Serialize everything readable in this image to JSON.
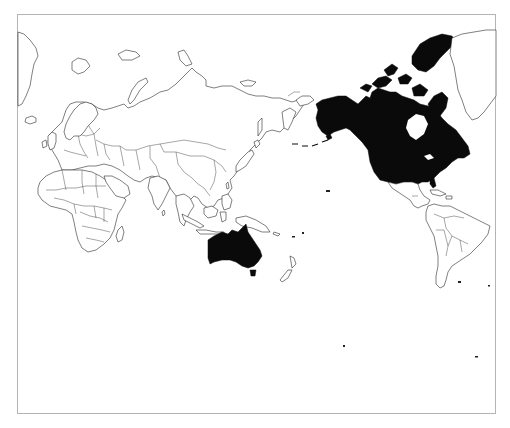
{
  "map": {
    "projection": "Pacific-centered world map",
    "style": {
      "background": "#ffffff",
      "outline_color": "#2a2a2a",
      "highlight_color": "#0a0a0a",
      "frame_color": "#b4b4b4"
    },
    "highlighted_regions": [
      {
        "name": "Canada",
        "fill": "#0a0a0a"
      },
      {
        "name": "United States (incl. Alaska)",
        "fill": "#0a0a0a"
      },
      {
        "name": "Australia (incl. Tasmania)",
        "fill": "#0a0a0a"
      }
    ],
    "outlined_regions": [
      "Greenland",
      "Europe",
      "Russia",
      "Africa",
      "Middle East",
      "Central Asia",
      "South Asia",
      "China",
      "Mongolia",
      "Japan",
      "Southeast Asia",
      "Indonesia",
      "Papua New Guinea",
      "New Zealand",
      "Mexico",
      "Central America",
      "Caribbean",
      "South America",
      "Madagascar",
      "Iceland",
      "Svalbard",
      "Novaya Zemlya"
    ]
  }
}
